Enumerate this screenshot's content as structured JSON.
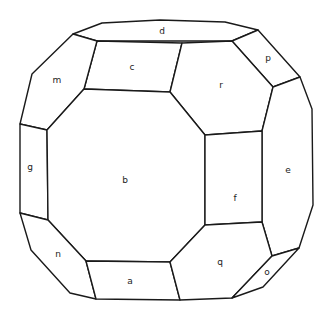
{
  "diagram": {
    "type": "crystal-habit-drawing",
    "colors": {
      "stroke": "#1a1a1a",
      "fill": "#ffffff",
      "label": "#222222"
    },
    "faces": [
      {
        "label": "d",
        "points": "73,34 102,23 160,20 225,22 258,30 232,41 97,41",
        "lx": 162,
        "ly": 31
      },
      {
        "label": "c",
        "points": "97,41 182,43 170,92 84,89",
        "lx": 132,
        "ly": 67
      },
      {
        "label": "m",
        "points": "73,34 97,41 84,89 47,130 20,124 32,74",
        "lx": 57,
        "ly": 80
      },
      {
        "label": "p",
        "points": "232,41 258,30 300,77 273,87",
        "lx": 268,
        "ly": 58
      },
      {
        "label": "r",
        "points": "182,43 232,41 273,87 262,131 205,135 170,92",
        "lx": 221,
        "ly": 85
      },
      {
        "label": "e",
        "points": "273,87 300,77 312,109 313,205 299,248 272,256 262,222 262,131",
        "lx": 288,
        "ly": 170
      },
      {
        "label": "g",
        "points": "20,124 47,130 48,220 20,213",
        "lx": 30,
        "ly": 167
      },
      {
        "label": "b",
        "points": "47,130 84,89 170,92 205,135 205,225 170,262 86,261 48,220",
        "lx": 125,
        "ly": 180
      },
      {
        "label": "f",
        "points": "205,135 262,131 262,222 205,225",
        "lx": 235,
        "ly": 198
      },
      {
        "label": "n",
        "points": "20,213 48,220 86,261 96,299 70,293 31,250",
        "lx": 58,
        "ly": 254
      },
      {
        "label": "a",
        "points": "86,261 170,262 180,300 96,299",
        "lx": 130,
        "ly": 281
      },
      {
        "label": "q",
        "points": "205,225 262,222 272,256 232,298 180,300 170,262",
        "lx": 220,
        "ly": 262
      },
      {
        "label": "o",
        "points": "272,256 299,248 263,287 232,298",
        "lx": 267,
        "ly": 272
      }
    ]
  }
}
